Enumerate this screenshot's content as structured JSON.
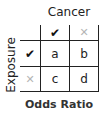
{
  "diagram": {
    "column_title": "Cancer",
    "row_title": "Exposure",
    "caption": "Odds Ratio",
    "column_headers": [
      {
        "icon": "check-icon",
        "glyph": "✔"
      },
      {
        "icon": "cross-icon",
        "glyph": "✕"
      }
    ],
    "row_headers": [
      {
        "icon": "check-icon",
        "glyph": "✔"
      },
      {
        "icon": "cross-icon",
        "glyph": "✕"
      }
    ],
    "cells": [
      [
        "a",
        "b"
      ],
      [
        "c",
        "d"
      ]
    ],
    "colors": {
      "lines": "#222222",
      "check": "#111111",
      "cross": "#b5b5b5"
    }
  }
}
